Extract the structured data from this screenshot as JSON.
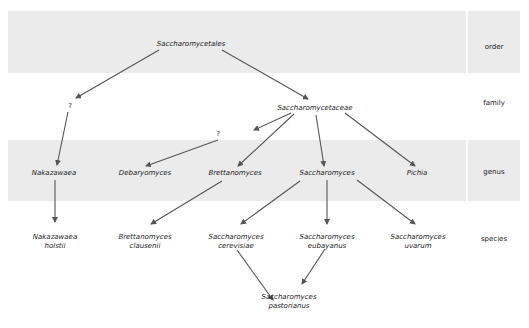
{
  "ranks": [
    {
      "label": "order"
    },
    {
      "label": "family"
    },
    {
      "label": "genus"
    },
    {
      "label": "species"
    }
  ],
  "nodes": {
    "saccharomycetales": "Saccharomycetales",
    "unknown_family": "?",
    "saccharomycetaceae": "Saccharomycetaceae",
    "unknown_edge": "?",
    "nakazawaea": "Nakazawaea",
    "debaryomyces": "Debaryomyces",
    "brettanomyces": "Brettanomyces",
    "saccharomyces": "Saccharomyces",
    "pichia": "Pichia",
    "nakazawaea_holstii": [
      "Nakazawaea",
      "holstii"
    ],
    "brettanomyces_clausenii": [
      "Brettanomyces",
      "clausenii"
    ],
    "saccharomyces_cerevisiae": [
      "Saccharomyces",
      "cerevisiae"
    ],
    "saccharomyces_eubayanus": [
      "Saccharomyces",
      "eubayanus"
    ],
    "saccharomyces_uvarum": [
      "Saccharomyces",
      "uvarum"
    ],
    "saccharomyces_pastorianus": [
      "Saccharomyces",
      "pastorianus"
    ]
  },
  "colors": {
    "band": "#ebebeb",
    "arrow": "#555555",
    "text": "#222222"
  }
}
